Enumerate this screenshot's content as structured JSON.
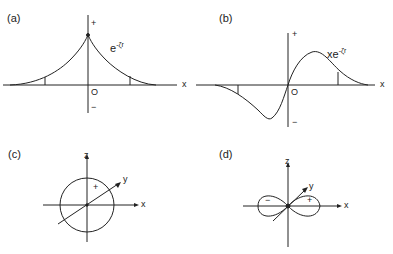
{
  "panels": {
    "a": {
      "label": "(a)",
      "function": "e",
      "exponent": "-ζr",
      "plus": "+",
      "minus": "−",
      "origin": "O",
      "axis": "x"
    },
    "b": {
      "label": "(b)",
      "function": "xe",
      "exponent": "-ζr",
      "plus": "+",
      "minus": "−",
      "origin": "O",
      "axis": "x"
    },
    "c": {
      "label": "(c)",
      "axis_z": "z",
      "axis_y": "y",
      "axis_x": "x",
      "sign": "+"
    },
    "d": {
      "label": "(d)",
      "axis_z": "z",
      "axis_y": "y",
      "axis_x": "x",
      "sign_neg": "−",
      "sign_pos": "+"
    }
  },
  "colors": {
    "line": "#222222",
    "background": "#ffffff"
  }
}
